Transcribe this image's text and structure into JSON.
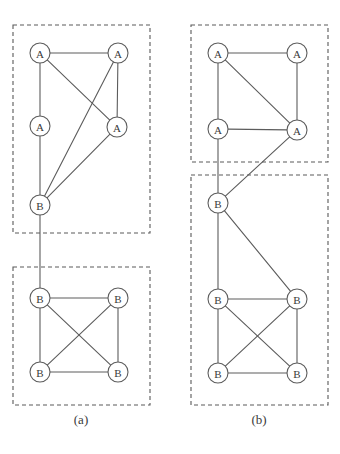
{
  "figure": {
    "width": 340,
    "height": 454,
    "background": "#ffffff",
    "stroke_color": "#5c5c5c",
    "box_color": "#5a5a5a",
    "label_color": "#3a3a3a",
    "node_radius": 10
  },
  "panels": [
    {
      "id": "panel-a",
      "caption": "(a)",
      "caption_x": 81,
      "caption_y": 424,
      "boxes": [
        {
          "name": "cluster-a-upper",
          "x": 13,
          "y": 25,
          "w": 137,
          "h": 208
        },
        {
          "name": "cluster-a-lower",
          "x": 13,
          "y": 267,
          "w": 137,
          "h": 138
        }
      ],
      "nodes": [
        {
          "id": "a1",
          "label": "A",
          "x": 40,
          "y": 53
        },
        {
          "id": "a2",
          "label": "A",
          "x": 118,
          "y": 53
        },
        {
          "id": "a3",
          "label": "A",
          "x": 40,
          "y": 126
        },
        {
          "id": "a4",
          "label": "A",
          "x": 117,
          "y": 127
        },
        {
          "id": "a5",
          "label": "B",
          "x": 40,
          "y": 205
        },
        {
          "id": "a6",
          "label": "B",
          "x": 40,
          "y": 298
        },
        {
          "id": "a7",
          "label": "B",
          "x": 118,
          "y": 298
        },
        {
          "id": "a8",
          "label": "B",
          "x": 40,
          "y": 372
        },
        {
          "id": "a9",
          "label": "B",
          "x": 118,
          "y": 372
        }
      ],
      "edges": [
        [
          "a1",
          "a2"
        ],
        [
          "a1",
          "a3"
        ],
        [
          "a1",
          "a4"
        ],
        [
          "a2",
          "a4"
        ],
        [
          "a2",
          "a5"
        ],
        [
          "a3",
          "a5"
        ],
        [
          "a4",
          "a5"
        ],
        [
          "a5",
          "a6"
        ],
        [
          "a6",
          "a7"
        ],
        [
          "a6",
          "a8"
        ],
        [
          "a6",
          "a9"
        ],
        [
          "a7",
          "a8"
        ],
        [
          "a7",
          "a9"
        ],
        [
          "a8",
          "a9"
        ]
      ]
    },
    {
      "id": "panel-b",
      "caption": "(b)",
      "caption_x": 259,
      "caption_y": 424,
      "boxes": [
        {
          "name": "cluster-b-upper",
          "x": 191,
          "y": 25,
          "w": 137,
          "h": 137
        },
        {
          "name": "cluster-b-lower",
          "x": 191,
          "y": 175,
          "w": 137,
          "h": 230
        }
      ],
      "nodes": [
        {
          "id": "b1",
          "label": "A",
          "x": 218,
          "y": 53
        },
        {
          "id": "b2",
          "label": "A",
          "x": 297,
          "y": 53
        },
        {
          "id": "b3",
          "label": "A",
          "x": 218,
          "y": 129
        },
        {
          "id": "b4",
          "label": "A",
          "x": 297,
          "y": 130
        },
        {
          "id": "b5",
          "label": "B",
          "x": 218,
          "y": 203
        },
        {
          "id": "b6",
          "label": "B",
          "x": 218,
          "y": 299
        },
        {
          "id": "b7",
          "label": "B",
          "x": 297,
          "y": 299
        },
        {
          "id": "b8",
          "label": "B",
          "x": 218,
          "y": 373
        },
        {
          "id": "b9",
          "label": "B",
          "x": 297,
          "y": 373
        }
      ],
      "edges": [
        [
          "b1",
          "b2"
        ],
        [
          "b1",
          "b3"
        ],
        [
          "b1",
          "b4"
        ],
        [
          "b2",
          "b4"
        ],
        [
          "b3",
          "b4"
        ],
        [
          "b3",
          "b5"
        ],
        [
          "b4",
          "b5"
        ],
        [
          "b5",
          "b6"
        ],
        [
          "b5",
          "b7"
        ],
        [
          "b6",
          "b7"
        ],
        [
          "b6",
          "b8"
        ],
        [
          "b6",
          "b9"
        ],
        [
          "b7",
          "b8"
        ],
        [
          "b7",
          "b9"
        ],
        [
          "b8",
          "b9"
        ]
      ]
    }
  ]
}
